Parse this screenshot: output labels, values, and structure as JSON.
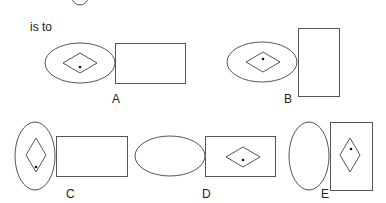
{
  "question": {
    "prefix_text": "is to"
  },
  "options": [
    {
      "label": "A",
      "ellipse": {
        "cx": 80,
        "cy": 63,
        "rx": 35,
        "ry": 20
      },
      "rect": {
        "x": 115,
        "y": 43,
        "w": 70,
        "h": 40
      },
      "diamond": {
        "cx": 80,
        "cy": 63,
        "w": 34,
        "h": 20
      },
      "dot": {
        "x": 80,
        "y": 67
      },
      "label_pos": {
        "x": 112,
        "y": 93
      }
    },
    {
      "label": "B",
      "ellipse": {
        "cx": 262,
        "cy": 62,
        "rx": 35,
        "ry": 20
      },
      "rect": {
        "x": 298,
        "y": 28,
        "w": 41,
        "h": 68
      },
      "diamond": {
        "cx": 263,
        "cy": 62,
        "w": 34,
        "h": 20
      },
      "dot": {
        "x": 263,
        "y": 59
      },
      "label_pos": {
        "x": 284,
        "y": 93
      }
    },
    {
      "label": "C",
      "ellipse": {
        "cx": 35,
        "cy": 156,
        "rx": 20,
        "ry": 34
      },
      "rect": {
        "x": 56,
        "y": 136,
        "w": 71,
        "h": 40
      },
      "diamond": {
        "cx": 36,
        "cy": 155,
        "w": 20,
        "h": 34
      },
      "dot": {
        "x": 36,
        "y": 167
      },
      "label_pos": {
        "x": 66,
        "y": 188
      }
    },
    {
      "label": "D",
      "ellipse": {
        "cx": 170,
        "cy": 156,
        "rx": 35,
        "ry": 20
      },
      "rect": {
        "x": 205,
        "y": 136,
        "w": 70,
        "h": 40
      },
      "diamond": {
        "cx": 243,
        "cy": 157,
        "w": 34,
        "h": 20
      },
      "dot": {
        "x": 243,
        "y": 160
      },
      "label_pos": {
        "x": 202,
        "y": 188
      }
    },
    {
      "label": "E",
      "ellipse": {
        "cx": 309,
        "cy": 156,
        "rx": 20,
        "ry": 34
      },
      "rect": {
        "x": 330,
        "y": 122,
        "w": 42,
        "h": 68
      },
      "diamond": {
        "cx": 350,
        "cy": 155,
        "w": 20,
        "h": 34
      },
      "dot": {
        "x": 351,
        "y": 149
      },
      "label_pos": {
        "x": 321,
        "y": 188
      }
    }
  ]
}
